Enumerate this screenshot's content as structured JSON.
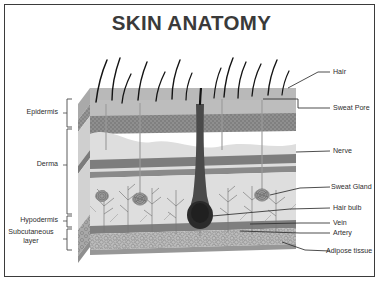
{
  "figure": {
    "title": "SKIN ANATOMY",
    "type": "anatomical-cross-section-diagram",
    "frame_border_color": "#3b3b3b",
    "background_color": "#ffffff",
    "title_color": "#3a3a3a"
  },
  "left_labels": [
    {
      "id": "epidermis",
      "text": "Epidermis"
    },
    {
      "id": "derma",
      "text": "Derma"
    },
    {
      "id": "hypodermis",
      "text": "Hypodermis"
    },
    {
      "id": "subcutaneous-line1",
      "text": "Subcutaneous"
    },
    {
      "id": "subcutaneous-line2",
      "text": "layer"
    }
  ],
  "right_labels": [
    {
      "id": "hair",
      "text": "Hair"
    },
    {
      "id": "sweat-pore",
      "text": "Sweat Pore"
    },
    {
      "id": "nerve",
      "text": "Nerve"
    },
    {
      "id": "sweat-gland",
      "text": "Sweat Gland"
    },
    {
      "id": "hair-bulb",
      "text": "Hair bulb"
    },
    {
      "id": "vein",
      "text": "Vein"
    },
    {
      "id": "artery",
      "text": "Artery"
    },
    {
      "id": "adipose-tissue",
      "text": "Adipose tissue"
    }
  ],
  "layers": [
    {
      "id": "epidermis-surface",
      "fill": "#b9b9b9"
    },
    {
      "id": "epidermis-stippled-band",
      "fill": "#8a8a8a"
    },
    {
      "id": "dermis",
      "fill": "#d8d8d8"
    },
    {
      "id": "vessel-band",
      "fill": "#7f7f7f"
    },
    {
      "id": "hypodermis",
      "fill": "#dcdcdc"
    },
    {
      "id": "adipose",
      "fill": "#b4b4b4"
    },
    {
      "id": "base-band",
      "fill": "#9a9a9a"
    }
  ],
  "colors": {
    "hair_dark": "#1a1a1a",
    "leader_line": "#2e2e2e",
    "bracket": "#4a4a4a",
    "vessel": "#6e6e6e",
    "nerve_branch": "#777777"
  }
}
